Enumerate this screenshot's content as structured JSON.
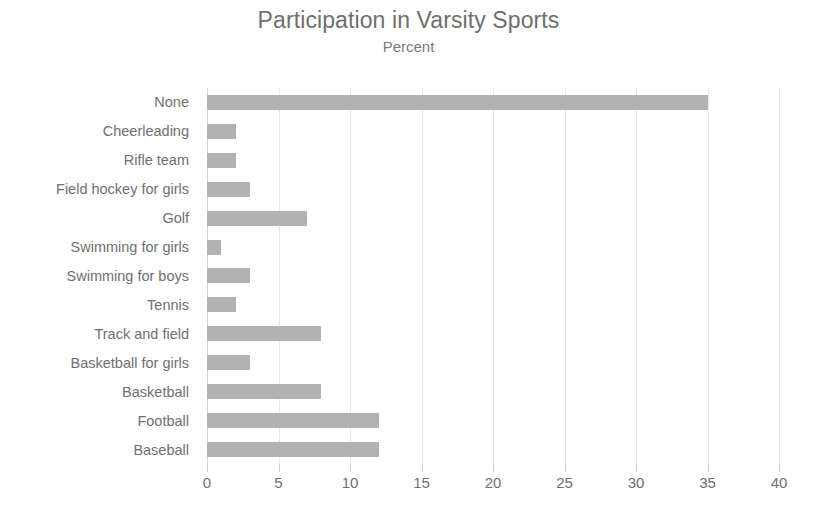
{
  "chart_data": {
    "type": "bar",
    "orientation": "horizontal",
    "title": "Participation in Varsity Sports",
    "subtitle": "Percent",
    "xlabel": "",
    "ylabel": "",
    "xlim": [
      0,
      40
    ],
    "xticks": [
      0,
      5,
      10,
      15,
      20,
      25,
      30,
      35,
      40
    ],
    "grid": "vertical",
    "legend": "none",
    "bar_color": "#b2b2b2",
    "text_color": "#6f6f6f",
    "gridline_color": "#e9e9e9",
    "categories": [
      "None",
      "Cheerleading",
      "Rifle team",
      "Field hockey for girls",
      "Golf",
      "Swimming for girls",
      "Swimming for boys",
      "Tennis",
      "Track and field",
      "Basketball for girls",
      "Basketball",
      "Football",
      "Baseball"
    ],
    "values": [
      35,
      2,
      2,
      3,
      7,
      1,
      3,
      2,
      8,
      3,
      8,
      12,
      12
    ]
  }
}
